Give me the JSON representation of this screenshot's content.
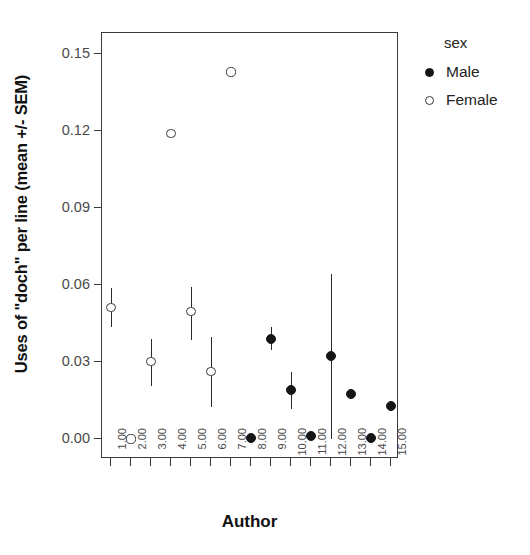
{
  "chart_data": {
    "type": "scatter",
    "title": "",
    "xlabel": "Author",
    "ylabel": "Uses of \"doch\" per line (mean +/- SEM)",
    "xlim": [
      0.5,
      15.5
    ],
    "ylim": [
      -0.005,
      0.157
    ],
    "ytick_labels": [
      "0.00",
      "0.03",
      "0.06",
      "0.09",
      "0.12",
      "0.15"
    ],
    "ytick_values": [
      0.0,
      0.03,
      0.06,
      0.09,
      0.12,
      0.15
    ],
    "xtick_labels": [
      "1.00",
      "2.00",
      "3.00",
      "4.00",
      "5.00",
      "6.00",
      "7.00",
      "8.00",
      "9.00",
      "10.00",
      "11.00",
      "12.00",
      "13.00",
      "14.00",
      "15.00"
    ],
    "xtick_values": [
      1,
      2,
      3,
      4,
      5,
      6,
      7,
      8,
      9,
      10,
      11,
      12,
      13,
      14,
      15
    ],
    "grid": false,
    "legend_position": "right",
    "legend_title": "sex",
    "series": [
      {
        "name": "Male",
        "marker": "filled-circle",
        "color": "#151515",
        "points": [
          {
            "x": 8,
            "y": 0.0005,
            "err_low": 0.0005,
            "err_high": 0.0005
          },
          {
            "x": 9,
            "y": 0.039,
            "err_low": 0.0345,
            "err_high": 0.0437
          },
          {
            "x": 10,
            "y": 0.019,
            "err_low": 0.0118,
            "err_high": 0.0261
          },
          {
            "x": 11,
            "y": 0.0013,
            "err_low": 0.0013,
            "err_high": 0.0013
          },
          {
            "x": 12,
            "y": 0.0322,
            "err_low": 0.0,
            "err_high": 0.0641
          },
          {
            "x": 13,
            "y": 0.0177,
            "err_low": 0.0177,
            "err_high": 0.0177
          },
          {
            "x": 14,
            "y": 0.0004,
            "err_low": 0.0004,
            "err_high": 0.0004
          },
          {
            "x": 15,
            "y": 0.013,
            "err_low": 0.013,
            "err_high": 0.013
          }
        ]
      },
      {
        "name": "Female",
        "marker": "open-circle",
        "color": "#3a3a3a",
        "points": [
          {
            "x": 1,
            "y": 0.0512,
            "err_low": 0.0436,
            "err_high": 0.059
          },
          {
            "x": 2,
            "y": 0.0,
            "err_low": 0.0,
            "err_high": 0.0
          },
          {
            "x": 3,
            "y": 0.0302,
            "err_low": 0.0208,
            "err_high": 0.039
          },
          {
            "x": 4,
            "y": 0.119,
            "err_low": 0.119,
            "err_high": 0.119
          },
          {
            "x": 5,
            "y": 0.0497,
            "err_low": 0.0385,
            "err_high": 0.0593
          },
          {
            "x": 6,
            "y": 0.0264,
            "err_low": 0.0124,
            "err_high": 0.0398
          },
          {
            "x": 7,
            "y": 0.143,
            "err_low": 0.143,
            "err_high": 0.143
          }
        ]
      }
    ]
  },
  "axes": {
    "ylabel": "Uses of \"doch\" per line (mean +/- SEM)",
    "xlabel": "Author"
  },
  "legend": {
    "title": "sex",
    "items": [
      {
        "label": "Male",
        "marker": "filled-circle"
      },
      {
        "label": "Female",
        "marker": "open-circle"
      }
    ]
  }
}
